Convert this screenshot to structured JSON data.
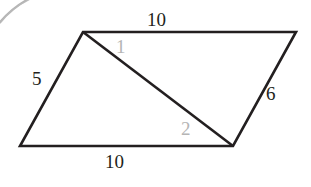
{
  "figure": {
    "kind": "geometry-diagram",
    "shape": "parallelogram-with-diagonal",
    "background_color": "#ffffff",
    "stroke_color": "#231f20",
    "side_label_color": "#231f20",
    "angle_label_color": "#b5b5b5",
    "artifact_color": "#9a9a9a",
    "vertices": {
      "top_left": {
        "x": 83,
        "y": 32
      },
      "top_right": {
        "x": 296,
        "y": 32
      },
      "bottom_right": {
        "x": 233,
        "y": 146
      },
      "bottom_left": {
        "x": 20,
        "y": 146
      }
    },
    "diagonal": {
      "from": "top_left",
      "to": "bottom_right"
    },
    "labels": {
      "top_side": "10",
      "left_side": "5",
      "right_side": "6",
      "bottom_side": "10",
      "angle_one": "1",
      "angle_two": "2"
    }
  }
}
